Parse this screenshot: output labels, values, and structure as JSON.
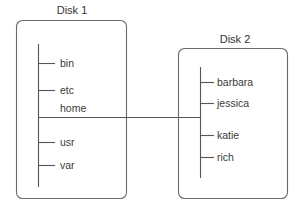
{
  "diagram": {
    "type": "filesystem-mount-tree",
    "colors": {
      "line": "#555555",
      "box": "#6a6a6a",
      "text": "#3a3a3a",
      "background": "#ffffff"
    },
    "disks": [
      {
        "title": "Disk 1",
        "directories": [
          "bin",
          "etc",
          "home",
          "usr",
          "var"
        ]
      },
      {
        "title": "Disk 2",
        "directories": [
          "barbara",
          "jessica",
          "katie",
          "rich"
        ]
      }
    ],
    "connection": {
      "from": "Disk 1/home",
      "to": "Disk 2/root"
    }
  }
}
